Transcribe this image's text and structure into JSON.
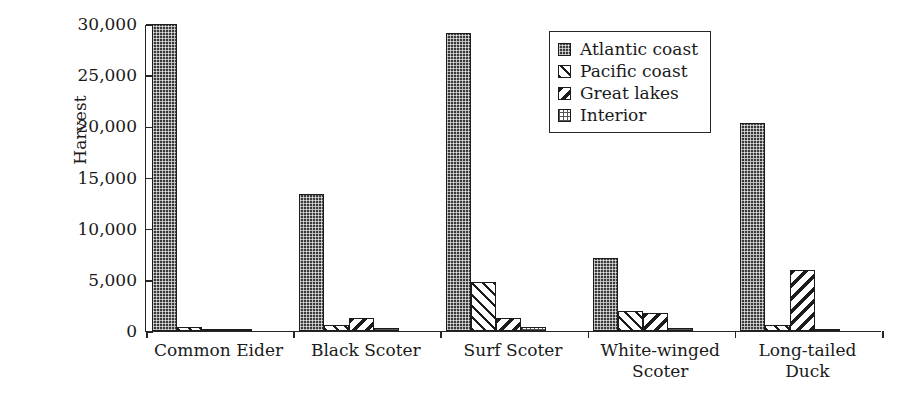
{
  "chart_data": {
    "type": "bar",
    "title": "",
    "xlabel": "",
    "ylabel": "Harvest",
    "ylim": [
      0,
      30000
    ],
    "yticks": [
      0,
      5000,
      10000,
      15000,
      20000,
      25000,
      30000
    ],
    "ytick_labels": [
      "0",
      "5,000",
      "10,000",
      "15,000",
      "20,000",
      "25,000",
      "30,000"
    ],
    "grid": false,
    "legend_position": "upper right",
    "categories": [
      "Common Eider",
      "Black Scoter",
      "Surf Scoter",
      "White-winged Scoter",
      "Long-tailed Duck"
    ],
    "series": [
      {
        "name": "Atlantic coast",
        "pattern": "dense-dark-checker",
        "values": [
          30000,
          13400,
          29100,
          7100,
          20300
        ]
      },
      {
        "name": "Pacific coast",
        "pattern": "light-backslash",
        "values": [
          350,
          550,
          4800,
          2000,
          600
        ]
      },
      {
        "name": "Great lakes",
        "pattern": "dark-forwardslash",
        "values": [
          60,
          1250,
          1300,
          1750,
          5950
        ]
      },
      {
        "name": "Interior",
        "pattern": "light-dotted",
        "values": [
          180,
          260,
          400,
          280,
          230
        ]
      }
    ]
  },
  "legend": {
    "entries": [
      {
        "label": "Atlantic coast"
      },
      {
        "label": "Pacific coast"
      },
      {
        "label": "Great lakes"
      },
      {
        "label": "Interior"
      }
    ]
  },
  "colors": {
    "axis": "#262626",
    "bar_outline": "#1c1c1c",
    "atlantic": "#3a3a3a",
    "background": "#ffffff"
  }
}
